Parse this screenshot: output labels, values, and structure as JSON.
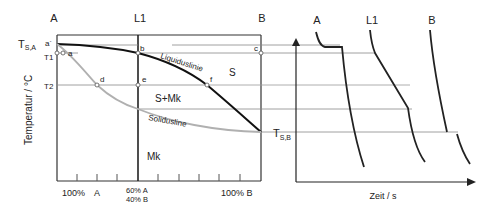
{
  "diagram": {
    "type": "phase-diagram-with-cooling-curves",
    "columns": {
      "a": "A",
      "l1": "L1",
      "b": "B"
    },
    "y_axis_label": "Temperatur / °C",
    "temperatures": {
      "tsa_main": "T",
      "tsa_sub": "S,A",
      "t1": "T1",
      "t2": "T2",
      "tsb_main": "T",
      "tsb_sub": "S,B"
    },
    "points": {
      "a_prime": "a´",
      "a": "a",
      "b": "b",
      "c": "c",
      "d": "d",
      "e": "e",
      "f": "f"
    },
    "regions": {
      "liquid": "S",
      "two_phase": "S+Mk",
      "solid": "Mk"
    },
    "curves": {
      "liquidus": "Liquiduslinie",
      "solidus": "Solidusline"
    },
    "x_axis": {
      "left_pct": "100%",
      "left_el": "A",
      "l1_line1": "60% A",
      "l1_line2": "40% B",
      "right": "100% B"
    },
    "cooling": {
      "curve_a": "A",
      "curve_l1": "L1",
      "curve_b": "B",
      "x_axis_label": "Zeit / s"
    },
    "colors": {
      "line": "#222222",
      "solidus": "#b0b0b0",
      "guide": "#888888"
    }
  }
}
